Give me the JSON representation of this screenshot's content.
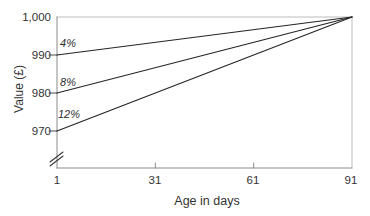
{
  "chart_data": {
    "type": "line",
    "title": "",
    "xlabel": "Age in days",
    "ylabel": "Value (£)",
    "xlim": [
      1,
      91
    ],
    "ylim": [
      970,
      1000
    ],
    "x_ticks": [
      1,
      31,
      61,
      91
    ],
    "x_tick_labels": [
      "1",
      "31",
      "61",
      "91"
    ],
    "y_ticks": [
      1000,
      990,
      980,
      970
    ],
    "y_tick_labels": [
      "1,000",
      "990",
      "980",
      "970"
    ],
    "y_axis_break": true,
    "grid": false,
    "legend": "inline-labels-near-line-start",
    "series": [
      {
        "name": "4%",
        "points": [
          [
            1,
            990
          ],
          [
            91,
            1000
          ]
        ]
      },
      {
        "name": "8%",
        "points": [
          [
            1,
            980
          ],
          [
            91,
            1000
          ]
        ]
      },
      {
        "name": "12%",
        "points": [
          [
            1,
            970
          ],
          [
            91,
            1000
          ]
        ]
      }
    ]
  },
  "colors": {
    "background": "#ffffff",
    "line": "#262626",
    "axis": "#8b8b8b",
    "border": "#bcbcbc",
    "tick_dark": "#4a4a4a",
    "text": "#333333"
  }
}
